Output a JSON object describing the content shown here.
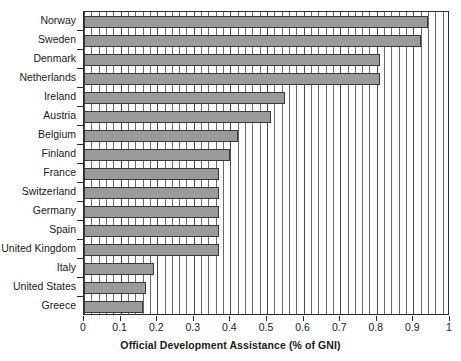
{
  "chart_data": {
    "type": "bar",
    "orientation": "horizontal",
    "title": "",
    "xlabel": "Official Development Assistance (% of GNI)",
    "ylabel": "",
    "xlim": [
      0,
      1
    ],
    "xticks": [
      "0",
      "0.1",
      "0.2",
      "0.3",
      "0.4",
      "0.5",
      "0.6",
      "0.7",
      "0.8",
      "0.9",
      "1"
    ],
    "xtick_values": [
      0,
      0.1,
      0.2,
      0.3,
      0.4,
      0.5,
      0.6,
      0.7,
      0.8,
      0.9,
      1
    ],
    "minor_tick_step": 0.02,
    "grid": "vertical-minor-and-major",
    "legend": "none",
    "bar_color": "#9a9a9a",
    "bar_edge_color": "#3a3a3a",
    "categories": [
      "Norway",
      "Sweden",
      "Denmark",
      "Netherlands",
      "Ireland",
      "Austria",
      "Belgium",
      "Finland",
      "France",
      "Switzerland",
      "Germany",
      "Spain",
      "United Kingdom",
      "Italy",
      "United States",
      "Greece"
    ],
    "values": [
      0.94,
      0.92,
      0.81,
      0.81,
      0.55,
      0.51,
      0.42,
      0.4,
      0.37,
      0.37,
      0.37,
      0.37,
      0.37,
      0.19,
      0.17,
      0.16
    ]
  }
}
